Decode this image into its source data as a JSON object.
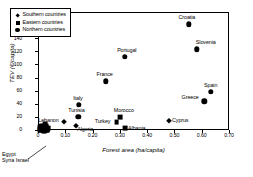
{
  "chart_data": {
    "type": "scatter",
    "title": "",
    "xlabel": "Forest area (ha/capita)",
    "ylabel": "TEV (€/capita)",
    "xlim": [
      0.0,
      0.7
    ],
    "ylim": [
      0,
      180
    ],
    "xticks": [
      "0",
      "0.10",
      "0.20",
      "0.30",
      "0.40",
      "0.50",
      "0.60",
      "0.70"
    ],
    "xtick_values": [
      0.0,
      0.1,
      0.2,
      0.3,
      0.4,
      0.5,
      0.6,
      0.7
    ],
    "yticks": [
      "0",
      "20",
      "40",
      "60",
      "80",
      "100",
      "120",
      "140",
      "160",
      "180"
    ],
    "ytick_values": [
      0,
      20,
      40,
      60,
      80,
      100,
      120,
      140,
      160,
      180
    ],
    "grid": false,
    "legend_position": "upper-left",
    "legend": [
      {
        "label": "Southern countries",
        "marker": "diamond"
      },
      {
        "label": "Eastern countries",
        "marker": "square"
      },
      {
        "label": "Northern countries",
        "marker": "circle"
      }
    ],
    "points": [
      {
        "name": "Croatia",
        "x": 0.553,
        "y": 161,
        "marker": "circle",
        "label_dx": -2,
        "label_dy": -9
      },
      {
        "name": "Slovenia",
        "x": 0.582,
        "y": 123,
        "marker": "circle",
        "label_dx": 9,
        "label_dy": -9
      },
      {
        "name": "Portugal",
        "x": 0.318,
        "y": 112,
        "marker": "circle",
        "label_dx": 2,
        "label_dy": -9
      },
      {
        "name": "France",
        "x": 0.248,
        "y": 74,
        "marker": "circle",
        "label_dx": -1,
        "label_dy": -9
      },
      {
        "name": "Spain",
        "x": 0.633,
        "y": 58,
        "marker": "circle",
        "label_dx": 0,
        "label_dy": -9
      },
      {
        "name": "Greece",
        "x": 0.609,
        "y": 44,
        "marker": "circle",
        "label_dx": -14,
        "label_dy": -6
      },
      {
        "name": "Italy",
        "x": 0.15,
        "y": 38,
        "marker": "circle",
        "label_dx": -1,
        "label_dy": -9
      },
      {
        "name": "Morocco",
        "x": 0.3,
        "y": 20,
        "marker": "square",
        "label_dx": 4,
        "label_dy": -9
      },
      {
        "name": "Cyprus",
        "x": 0.481,
        "y": 14,
        "marker": "diamond",
        "label_dx": 11,
        "label_dy": -3
      },
      {
        "name": "Lebanon",
        "x": 0.097,
        "y": 12,
        "marker": "diamond",
        "label_dx": -16,
        "label_dy": -4
      },
      {
        "name": "Turkey",
        "x": 0.288,
        "y": 12,
        "marker": "square",
        "label_dx": -14,
        "label_dy": -3
      },
      {
        "name": "Tunisia",
        "x": 0.148,
        "y": 20,
        "marker": "circle",
        "label_dx": -2,
        "label_dy": -9
      },
      {
        "name": "Algeria",
        "x": 0.14,
        "y": 6,
        "marker": "diamond",
        "label_dx": 9,
        "label_dy": 1
      },
      {
        "name": "Albania",
        "x": 0.318,
        "y": 3,
        "marker": "square",
        "label_dx": 12,
        "label_dy": -2
      }
    ],
    "cluster": {
      "labels": [
        "Egypt",
        "Syria Israel"
      ],
      "x": 0.022,
      "y": 4
    }
  }
}
